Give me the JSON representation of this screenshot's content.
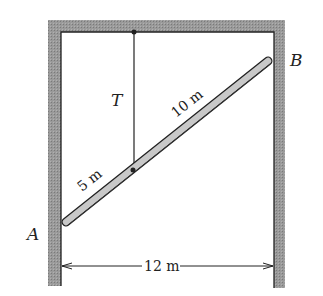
{
  "diagram": {
    "type": "statics-free-body",
    "labels": {
      "point_a": "A",
      "point_b": "B",
      "tension": "T",
      "segment_lower": "5 m",
      "segment_upper": "10 m",
      "span": "12 m"
    },
    "colors": {
      "wall": "#8c8c8c",
      "rod_fill": "#c8c8c8",
      "line": "#222222",
      "background": "#ffffff"
    }
  }
}
